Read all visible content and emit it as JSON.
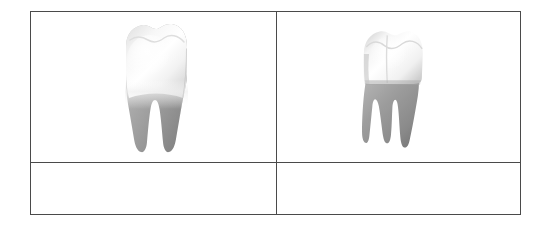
{
  "page": {
    "background_color": "#ffffff",
    "width": 546,
    "height": 225
  },
  "table": {
    "border_color": "#4a4a4a",
    "border_width_px": 1.5,
    "rows": 2,
    "columns": 2,
    "cells": [
      {
        "row": 0,
        "column": 0,
        "type": "image",
        "content_name": "tooth-frontal",
        "text": ""
      },
      {
        "row": 0,
        "column": 1,
        "type": "image",
        "content_name": "tooth-angled",
        "text": ""
      },
      {
        "row": 1,
        "column": 0,
        "type": "caption",
        "text": ""
      },
      {
        "row": 1,
        "column": 1,
        "type": "caption",
        "text": ""
      }
    ]
  },
  "figures": {
    "tooth_frontal": {
      "name": "molar-tooth-frontal-view",
      "description": "Molar tooth, frontal view",
      "crown_color": "#fbfbfb",
      "crown_shadow_color": "#d8d8d8",
      "root_color": "#9a9a9a",
      "root_shadow_color": "#7d7d7d",
      "root_count": 2
    },
    "tooth_angled": {
      "name": "molar-tooth-angled-view",
      "description": "Molar tooth, three-quarter angled view",
      "crown_color": "#fafafa",
      "crown_shadow_color": "#cfcfcf",
      "root_color": "#9d9d9d",
      "root_shadow_color": "#7a7a7a",
      "root_count": 3
    }
  }
}
